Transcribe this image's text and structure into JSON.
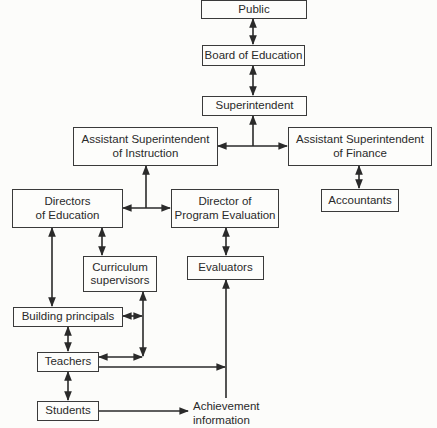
{
  "diagram": {
    "nodes": {
      "public": "Public",
      "board": "Board of Education",
      "superintendent": "Superintendent",
      "asst_instruction": "Assistant Superintendent\nof Instruction",
      "asst_finance": "Assistant Superintendent\nof Finance",
      "accountants": "Accountants",
      "directors_education": "Directors\nof Education",
      "director_program_eval": "Director of\nProgram Evaluation",
      "curriculum_supervisors": "Curriculum\nsupervisors",
      "evaluators": "Evaluators",
      "building_principals": "Building principals",
      "teachers": "Teachers",
      "students": "Students"
    },
    "achievement_label": "Achievement\ninformation",
    "edges": [
      {
        "from": "Public",
        "to": "Board of Education",
        "type": "bidirectional"
      },
      {
        "from": "Board of Education",
        "to": "Superintendent",
        "type": "bidirectional"
      },
      {
        "from": "Superintendent",
        "to": "Assistant Superintendent of Instruction",
        "type": "bidirectional"
      },
      {
        "from": "Superintendent",
        "to": "Assistant Superintendent of Finance",
        "type": "bidirectional"
      },
      {
        "from": "Assistant Superintendent of Finance",
        "to": "Accountants",
        "type": "bidirectional"
      },
      {
        "from": "Assistant Superintendent of Instruction",
        "to": "Directors of Education",
        "type": "bidirectional"
      },
      {
        "from": "Assistant Superintendent of Instruction",
        "to": "Director of Program Evaluation",
        "type": "bidirectional"
      },
      {
        "from": "Directors of Education",
        "to": "Curriculum supervisors",
        "type": "bidirectional"
      },
      {
        "from": "Directors of Education",
        "to": "Building principals",
        "type": "bidirectional"
      },
      {
        "from": "Director of Program Evaluation",
        "to": "Evaluators",
        "type": "bidirectional"
      },
      {
        "from": "Curriculum supervisors",
        "to": "Building principals",
        "type": "bidirectional"
      },
      {
        "from": "Curriculum supervisors",
        "to": "Teachers",
        "type": "bidirectional"
      },
      {
        "from": "Building principals",
        "to": "Teachers",
        "type": "bidirectional"
      },
      {
        "from": "Teachers",
        "to": "Students",
        "type": "bidirectional"
      },
      {
        "from": "Teachers",
        "to": "Achievement information",
        "type": "directed"
      },
      {
        "from": "Students",
        "to": "Achievement information",
        "type": "directed"
      },
      {
        "from": "Achievement information",
        "to": "Evaluators",
        "type": "directed"
      }
    ]
  }
}
